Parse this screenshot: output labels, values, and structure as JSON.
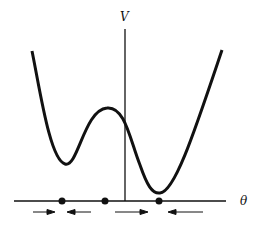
{
  "diagram": {
    "y_axis_label": "V",
    "x_axis_label": "θ",
    "curve": "double-well potential V(θ) with shallow left minimum, central maximum, deeper right minimum",
    "equilibrium_points": [
      {
        "name": "left minimum",
        "type": "stable",
        "x_px": 62
      },
      {
        "name": "maximum",
        "type": "unstable",
        "x_px": 105
      },
      {
        "name": "right minimum",
        "type": "stable",
        "x_px": 159
      }
    ],
    "flow_arrows": [
      {
        "direction": "right",
        "from_px": 33,
        "to_px": 55
      },
      {
        "direction": "left",
        "from_px": 91,
        "to_px": 67
      },
      {
        "direction": "right",
        "from_px": 115,
        "to_px": 148
      },
      {
        "direction": "left",
        "from_px": 203,
        "to_px": 168
      }
    ],
    "colors": {
      "line": "#111111",
      "background": "#ffffff"
    }
  }
}
